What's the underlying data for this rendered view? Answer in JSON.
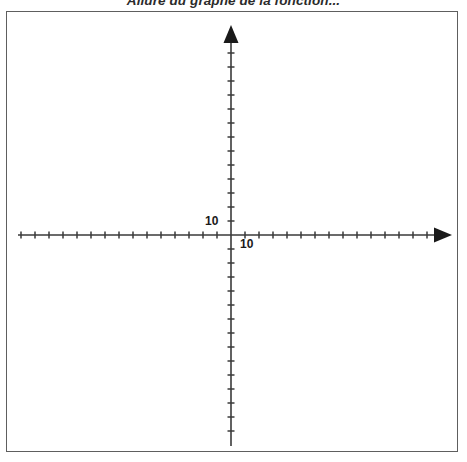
{
  "figure": {
    "title": "Allure du graphe de la fonction...",
    "width": 467,
    "height": 462,
    "background_color": "#ffffff",
    "frame_color": "#5e5e5e",
    "axis_color": "#333333"
  },
  "chart_data": {
    "type": "line",
    "title": "Allure du graphe de la fonction...",
    "xlabel": "",
    "ylabel": "",
    "grid": false,
    "legend": null,
    "series": [],
    "annotations": [
      {
        "name": "y-axis-tick-label",
        "text": "10",
        "axis": "y",
        "value": 10
      },
      {
        "name": "x-axis-tick-label",
        "text": "10",
        "axis": "x",
        "value": 10
      }
    ],
    "axes": {
      "origin_px": {
        "x": 231,
        "y": 235
      },
      "tick_spacing_px": 14,
      "tick_length_px": 7,
      "x_axis": {
        "tick_labels": [
          "10"
        ],
        "tick_label_values": [
          10
        ],
        "ticks_left_of_origin": 15,
        "ticks_right_of_origin": 14,
        "arrow": "right",
        "start_px": 18,
        "end_px": 450
      },
      "y_axis": {
        "tick_labels": [
          "10"
        ],
        "tick_label_values": [
          10
        ],
        "ticks_above_origin": 14,
        "ticks_below_origin": 14,
        "arrow": "up",
        "start_px": 25,
        "end_px": 446
      }
    }
  },
  "labels": {
    "y_ten": "10",
    "x_ten": "10"
  }
}
